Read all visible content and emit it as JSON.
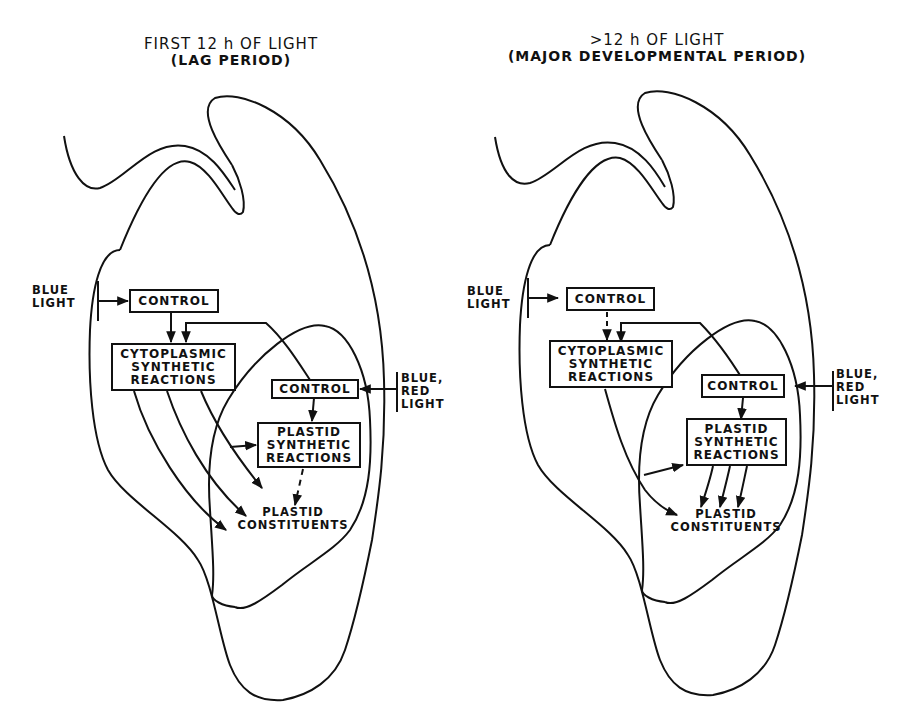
{
  "figure": {
    "colors": {
      "line": "#111111",
      "background": "#ffffff"
    },
    "panels": [
      {
        "id": "lag",
        "title_line1": "FIRST 12 h OF LIGHT",
        "title_line2": "(LAG PERIOD)",
        "input_light_1": {
          "line1": "BLUE",
          "line2": "LIGHT"
        },
        "control_1": "CONTROL",
        "cytoplasmic_box": {
          "line1": "CYTOPLASMIC",
          "line2": "SYNTHETIC",
          "line3": "REACTIONS"
        },
        "control_2": "CONTROL",
        "input_light_2": {
          "line1": "BLUE,",
          "line2": "RED",
          "line3": "LIGHT"
        },
        "plastid_box": {
          "line1": "PLASTID",
          "line2": "SYNTHETIC",
          "line3": "REACTIONS"
        },
        "constituents": {
          "line1": "PLASTID",
          "line2": "CONSTITUENTS"
        },
        "control_to_cytoplasmic": "solid",
        "plastid_to_constituents": "dashed",
        "cytoplasmic_to_constituents_arrows": 3
      },
      {
        "id": "major",
        "title_line1": ">12 h OF LIGHT",
        "title_line2": "(MAJOR DEVELOPMENTAL PERIOD)",
        "input_light_1": {
          "line1": "BLUE",
          "line2": "LIGHT"
        },
        "control_1": "CONTROL",
        "cytoplasmic_box": {
          "line1": "CYTOPLASMIC",
          "line2": "SYNTHETIC",
          "line3": "REACTIONS"
        },
        "control_2": "CONTROL",
        "input_light_2": {
          "line1": "BLUE,",
          "line2": "RED",
          "line3": "LIGHT"
        },
        "plastid_box": {
          "line1": "PLASTID",
          "line2": "SYNTHETIC",
          "line3": "REACTIONS"
        },
        "constituents": {
          "line1": "PLASTID",
          "line2": "CONSTITUENTS"
        },
        "control_to_cytoplasmic": "dashed",
        "plastid_to_constituents": "solid",
        "plastid_to_constituents_arrows": 3
      }
    ]
  }
}
